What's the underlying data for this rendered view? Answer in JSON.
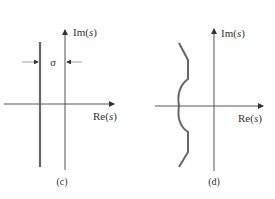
{
  "panels": [
    {
      "id": "c",
      "caption": "(c)",
      "axis_labels": {
        "imag": "Im(s)",
        "real": "Re(s)"
      },
      "annotation": "σ",
      "description": "Vertical line offset left of imaginary axis by σ"
    },
    {
      "id": "d",
      "caption": "(d)",
      "axis_labels": {
        "imag": "Im(s)",
        "real": "Re(s)"
      },
      "description": "Curved contour in left half-plane bulging left at real axis"
    }
  ],
  "colors": {
    "axis": "#555555",
    "contour": "#666666",
    "text": "#333333"
  }
}
